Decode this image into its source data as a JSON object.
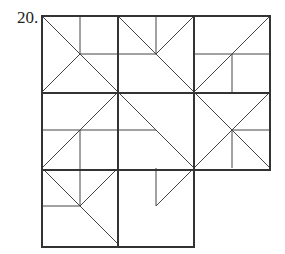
{
  "problem": {
    "number_label": "20."
  },
  "figure": {
    "grid": {
      "rows": 3,
      "cols": 3,
      "missing_cells": [
        [
          2,
          2
        ]
      ]
    },
    "colors": {
      "line": "#333333",
      "background": "#ffffff"
    },
    "cells": [
      {
        "row": 0,
        "col": 0,
        "segments": [
          "TL-BR",
          "TM-C",
          "C-RM",
          "C-BL"
        ]
      },
      {
        "row": 0,
        "col": 1,
        "segments": [
          "TL-BR",
          "C-TR",
          "TM-C",
          "LM-C"
        ]
      },
      {
        "row": 0,
        "col": 2,
        "segments": [
          "BL-TR",
          "LM-RM",
          "C-BM"
        ]
      },
      {
        "row": 1,
        "col": 0,
        "segments": [
          "BL-TR",
          "LM-RM",
          "C-BM"
        ]
      },
      {
        "row": 1,
        "col": 1,
        "segments": [
          "TL-BR",
          "LM-C"
        ]
      },
      {
        "row": 1,
        "col": 2,
        "segments": [
          "TL-BR",
          "BL-TR",
          "C-RM",
          "C-BM"
        ]
      },
      {
        "row": 2,
        "col": 0,
        "segments": [
          "TL-BR",
          "C-TR",
          "TM-C",
          "LM-C"
        ]
      },
      {
        "row": 2,
        "col": 1,
        "segments": [
          "TM-C",
          "C-TR"
        ]
      }
    ]
  }
}
